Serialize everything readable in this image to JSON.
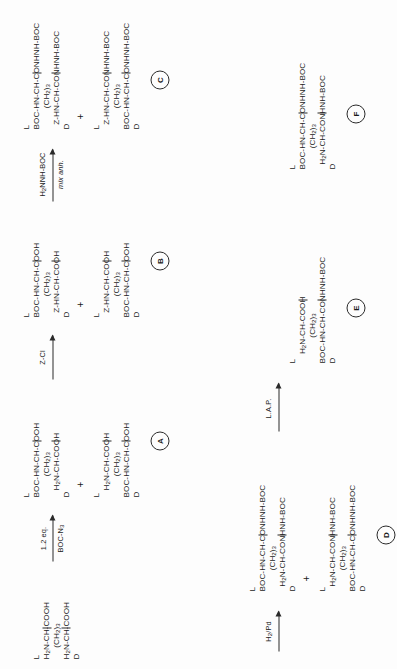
{
  "scheme": {
    "title": "Synthesis scheme of protected diaminopimelic acid derivatives",
    "orientation": "rotated-90-ccw",
    "compounds": [
      {
        "id": "start1",
        "tag": "",
        "lines": [
          {
            "stereo": "L",
            "text": "H2N-CH-COOH"
          },
          {
            "stereo": "",
            "text": "(CH2)3"
          },
          {
            "stereo": "D",
            "text": "H2N-CH-COOH"
          }
        ]
      },
      {
        "id": "A1",
        "tag": "",
        "lines": [
          {
            "stereo": "L",
            "text": "BOC-HN-CH-COOH"
          },
          {
            "stereo": "",
            "text": "(CH2)3"
          },
          {
            "stereo": "D",
            "text": "H2N-CH-COOH"
          }
        ]
      },
      {
        "id": "A2",
        "tag": "A",
        "lines": [
          {
            "stereo": "L",
            "text": "H2N-CH-COOH"
          },
          {
            "stereo": "",
            "text": "(CH2)3"
          },
          {
            "stereo": "D",
            "text": "BOC-HN-CH-COOH"
          }
        ]
      },
      {
        "id": "B1",
        "tag": "",
        "lines": [
          {
            "stereo": "L",
            "text": "BOC-HN-CH-COOH"
          },
          {
            "stereo": "",
            "text": "(CH2)3"
          },
          {
            "stereo": "D",
            "text": "Z-HN-CH-COOH"
          }
        ]
      },
      {
        "id": "B2",
        "tag": "B",
        "lines": [
          {
            "stereo": "L",
            "text": "Z-HN-CH-COOH"
          },
          {
            "stereo": "",
            "text": "(CH2)3"
          },
          {
            "stereo": "D",
            "text": "BOC-HN-CH-COOH"
          }
        ]
      },
      {
        "id": "C1",
        "tag": "",
        "lines": [
          {
            "stereo": "L",
            "text": "BOC-HN-CH-CONHNH-BOC"
          },
          {
            "stereo": "",
            "text": "(CH2)3"
          },
          {
            "stereo": "D",
            "text": "Z-HN-CH-CONHNH-BOC"
          }
        ]
      },
      {
        "id": "C2",
        "tag": "C",
        "lines": [
          {
            "stereo": "L",
            "text": "Z-HN-CH-CONHNH-BOC"
          },
          {
            "stereo": "",
            "text": "(CH2)3"
          },
          {
            "stereo": "D",
            "text": "BOC-HN-CH-CONHNH-BOC"
          }
        ]
      },
      {
        "id": "F",
        "tag": "F",
        "lines": [
          {
            "stereo": "L",
            "text": "BOC-HN-CH-CONHNH-BOC"
          },
          {
            "stereo": "",
            "text": "(CH2)3"
          },
          {
            "stereo": "D",
            "text": "H2N-CH-CONHNH-BOC"
          }
        ]
      },
      {
        "id": "D1",
        "tag": "",
        "lines": [
          {
            "stereo": "L",
            "text": "BOC-HN-CH-CONHNH-BOC"
          },
          {
            "stereo": "",
            "text": "(CH2)3"
          },
          {
            "stereo": "D",
            "text": "H2N-CH-CONHNH-BOC"
          }
        ]
      },
      {
        "id": "D2",
        "tag": "D",
        "lines": [
          {
            "stereo": "L",
            "text": "H2N-CH-CONHNH-BOC"
          },
          {
            "stereo": "",
            "text": "(CH2)3"
          },
          {
            "stereo": "D",
            "text": "BOC-HN-CH-CONHNH-BOC"
          }
        ]
      },
      {
        "id": "E",
        "tag": "E",
        "lines": [
          {
            "stereo": "L",
            "text": "H2N-CH-COOH"
          },
          {
            "stereo": "",
            "text": "(CH2)3"
          },
          {
            "stereo": "D",
            "text": "BOC-HN-CH-CONHNH-BOC"
          }
        ]
      }
    ],
    "reagents": [
      {
        "id": "r1",
        "above": "1.2 eq.",
        "below": "BOC-N3"
      },
      {
        "id": "r2",
        "above": "Z-Cl",
        "below": ""
      },
      {
        "id": "r3",
        "above": "H2NNH-BOC",
        "below": "mix anh."
      },
      {
        "id": "r4",
        "above": "H2/Pd",
        "below": ""
      },
      {
        "id": "r5",
        "above": "L.A.P.",
        "below": ""
      }
    ],
    "plus_symbol": "+"
  }
}
